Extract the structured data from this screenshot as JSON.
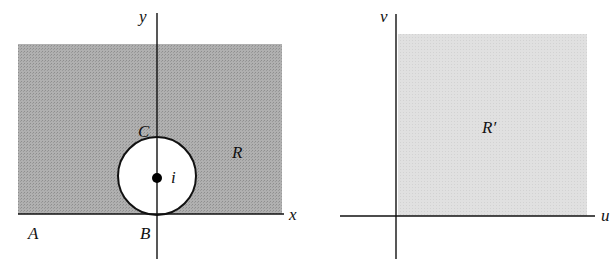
{
  "figure": {
    "left_panel": {
      "region_label": "R",
      "axis_x_label": "x",
      "axis_y_label": "y",
      "point_labels": {
        "A": "A",
        "B": "B",
        "C": "C",
        "center": "i"
      },
      "region_color": "#a9a9a9",
      "hole_color": "#ffffff"
    },
    "right_panel": {
      "region_label": "R′",
      "axis_u_label": "u",
      "axis_v_label": "v",
      "region_color": "#dedede"
    },
    "colors": {
      "axis": "#111111",
      "background": "#ffffff"
    }
  }
}
